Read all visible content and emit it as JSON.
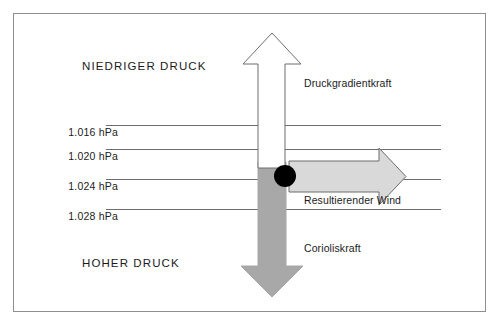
{
  "diagram": {
    "title_internal": "Geostrophischer Wind - Kraeftegleichgewicht",
    "background_color": "#ffffff",
    "border_color": "#8e8e8e",
    "zone_labels": {
      "low_pressure": "NIEDRIGER DRUCK",
      "high_pressure": "HOHER DRUCK"
    },
    "isobars": [
      {
        "label": "1.016 hPa",
        "value": 1016,
        "unit": "hPa",
        "y": 124
      },
      {
        "label": "1.020 hPa",
        "value": 1020,
        "unit": "hPa",
        "y": 148
      },
      {
        "label": "1.024 hPa",
        "value": 1024,
        "unit": "hPa",
        "y": 178
      },
      {
        "label": "1.028 hPa",
        "value": 1028,
        "unit": "hPa",
        "y": 208
      }
    ],
    "line_color": "#6d6d6d",
    "forces": [
      {
        "name": "pressure-gradient-force",
        "label": "Druckgradientkraft",
        "direction": "up",
        "fill": "#ffffff",
        "stroke": "#6d6d6d"
      },
      {
        "name": "resultant-wind",
        "label": "Resultierender Wind",
        "direction": "right",
        "fill": "#d9d9d9",
        "stroke": "#6d6d6d"
      },
      {
        "name": "coriolis-force",
        "label": "Corioliskraft",
        "direction": "down",
        "fill": "#a8a8a8",
        "stroke": "#a8a8a8"
      }
    ],
    "air_parcel": {
      "name": "air-parcel-marker",
      "color": "#000000"
    }
  }
}
